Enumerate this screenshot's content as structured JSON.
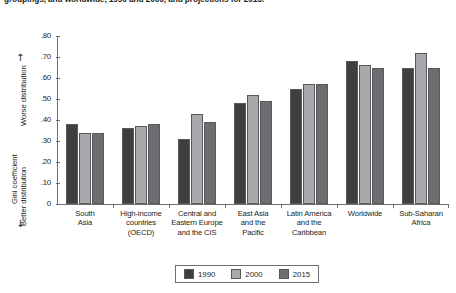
{
  "caption": {
    "text": "groupings, and worldwide, 1990 and 2000, and projections for 2015."
  },
  "axis": {
    "y_title": "Gini coefficient",
    "y_top_note": "Worse distribution",
    "y_bottom_note": "Better distribution",
    "arrow_up": "↑",
    "arrow_down": "↓"
  },
  "legend": {
    "items": [
      {
        "label": "1990",
        "color": "#3f3f3f"
      },
      {
        "label": "2000",
        "color": "#a7a9ac"
      },
      {
        "label": "2015",
        "color": "#6d6e71"
      }
    ]
  },
  "chart_data": {
    "type": "bar",
    "title": "",
    "xlabel": "",
    "ylabel": "Gini coefficient",
    "ylim": [
      0,
      0.8
    ],
    "ytick_labels": [
      "0",
      ".10",
      ".20",
      ".30",
      ".40",
      ".50",
      ".60",
      ".70",
      ".80"
    ],
    "ytick_values": [
      0,
      0.1,
      0.2,
      0.3,
      0.4,
      0.5,
      0.6,
      0.7,
      0.8
    ],
    "grid": false,
    "legend_position": "bottom",
    "categories": [
      "South\nAsia",
      "High-income\ncountries\n(OECD)",
      "Central and\nEastern Europe\nand the CIS",
      "East Asia\nand the\nPacific",
      "Latin America\nand the\nCaribbean",
      "Worldwide",
      "Sub-Saharan\nAfrica"
    ],
    "category_lines": [
      [
        "South",
        "Asia"
      ],
      [
        "High-income",
        "countries",
        "(OECD)"
      ],
      [
        "Central and",
        "Eastern Europe",
        "and the CIS"
      ],
      [
        "East Asia",
        "and the",
        "Pacific"
      ],
      [
        "Latin America",
        "and the",
        "Caribbean"
      ],
      [
        "Worldwide"
      ],
      [
        "Sub-Saharan",
        "Africa"
      ]
    ],
    "series": [
      {
        "name": "1990",
        "color": "#3f3f3f",
        "values": [
          0.38,
          0.36,
          0.31,
          0.48,
          0.55,
          0.68,
          0.65
        ]
      },
      {
        "name": "2000",
        "color": "#a7a9ac",
        "values": [
          0.34,
          0.37,
          0.43,
          0.52,
          0.57,
          0.66,
          0.72
        ]
      },
      {
        "name": "2015",
        "color": "#6d6e71",
        "values": [
          0.34,
          0.38,
          0.39,
          0.49,
          0.57,
          0.65,
          0.65
        ]
      }
    ]
  }
}
